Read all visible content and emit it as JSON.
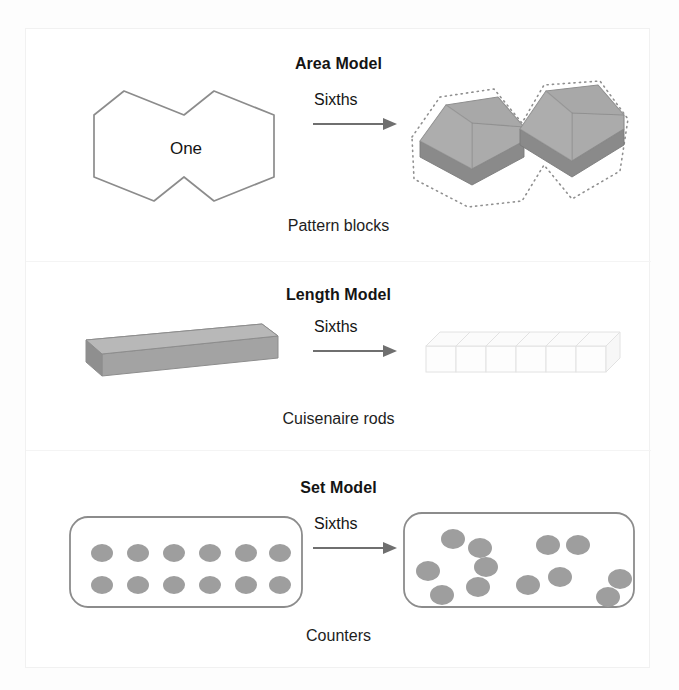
{
  "figure": {
    "models": [
      {
        "id": "area",
        "title": "Area Model",
        "caption": "Pattern blocks",
        "arrow_label": "Sixths",
        "whole_label": "One",
        "whole_shape": "double-hexagon-outline",
        "parts_shape": "two-3d-hexagon-pattern-blocks",
        "parts_count": 6,
        "manipulative": "Pattern blocks"
      },
      {
        "id": "length",
        "title": "Length Model",
        "caption": "Cuisenaire rods",
        "arrow_label": "Sixths",
        "whole_shape": "3d-solid-rod",
        "parts_shape": "six-3d-unit-cubes",
        "parts_count": 6,
        "manipulative": "Cuisenaire rods"
      },
      {
        "id": "set",
        "title": "Set Model",
        "caption": "Counters",
        "arrow_label": "Sixths",
        "whole_shape": "rounded-rectangle-with-12-counters-grid",
        "parts_shape": "rounded-rectangle-with-12-counters-in-6-pairs",
        "counter_total": 12,
        "counter_rows": 2,
        "counter_columns": 6,
        "parts_count": 6,
        "manipulative": "Counters"
      }
    ]
  },
  "colors": {
    "block_fill": "#a8a8a8",
    "block_top": "#b4b4b4",
    "block_side": "#8e8e8e",
    "counter_fill": "#9e9e9e",
    "outline_stroke": "#8c8c8c",
    "arrow_stroke": "#6f6f6f",
    "text": "#141414",
    "page_background": "#fdfdfd",
    "panel_background": "#ffffff"
  },
  "counters_grid": {
    "rows": 2,
    "columns": 6,
    "positions": [
      [
        28,
        26
      ],
      [
        64,
        26
      ],
      [
        100,
        26
      ],
      [
        136,
        26
      ],
      [
        172,
        26
      ],
      [
        206,
        26
      ],
      [
        28,
        58
      ],
      [
        64,
        58
      ],
      [
        100,
        58
      ],
      [
        136,
        58
      ],
      [
        172,
        58
      ],
      [
        206,
        58
      ]
    ]
  },
  "counters_scatter": {
    "pairs": [
      [
        [
          33,
          16
        ],
        [
          60,
          25
        ]
      ],
      [
        [
          128,
          22
        ],
        [
          158,
          22
        ]
      ],
      [
        [
          8,
          48
        ],
        [
          22,
          72
        ]
      ],
      [
        [
          66,
          44
        ],
        [
          58,
          64
        ]
      ],
      [
        [
          108,
          62
        ],
        [
          140,
          54
        ]
      ],
      [
        [
          200,
          56
        ],
        [
          188,
          74
        ]
      ]
    ]
  },
  "length_segments": {
    "count": 6,
    "labels": [
      "1",
      "2",
      "3",
      "4",
      "5",
      "6"
    ]
  }
}
